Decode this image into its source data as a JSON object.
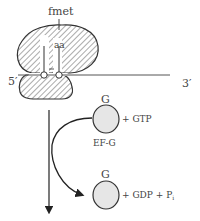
{
  "ribosome": {
    "peptide_label": "fmet",
    "aa_label": "aa",
    "mrna_5prime": "5′",
    "mrna_3prime": "3′"
  },
  "ef_g_cycle": {
    "top": {
      "top_label": "G",
      "factor_label": "EF-G",
      "reactant": "+ GTP"
    },
    "bottom": {
      "top_label": "G",
      "product_main": "+ GDP + P",
      "product_subscript": "i"
    }
  },
  "colors": {
    "hatch": "#555555",
    "outline": "#333333",
    "circle_fill": "#e6e6e6",
    "text": "#444444"
  }
}
